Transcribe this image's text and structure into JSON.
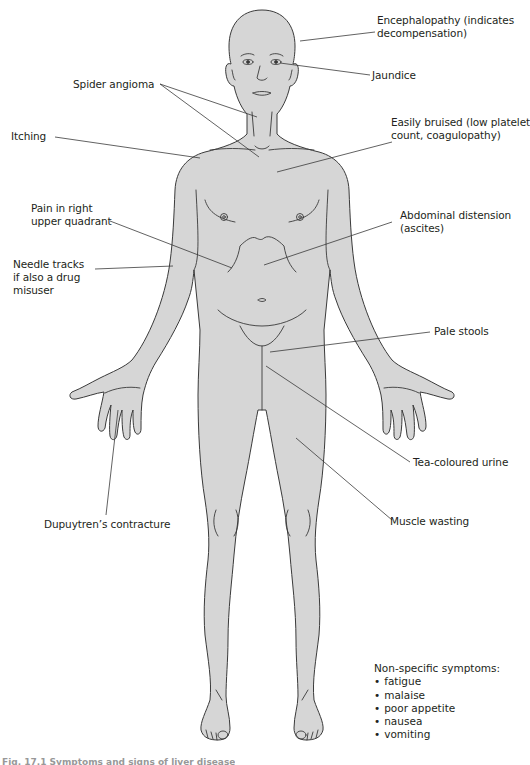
{
  "figure": {
    "type": "anatomical-diagram",
    "colors": {
      "skin_fill": "#d6d6d6",
      "outline": "#3a3a3a",
      "leader_line": "#3a3a3a",
      "text": "#231f20",
      "background": "#ffffff"
    }
  },
  "labels": {
    "encephalopathy": [
      "Encephalopathy (indicates",
      "decompensation)"
    ],
    "jaundice": [
      "Jaundice"
    ],
    "spider_angioma": [
      "Spider angioma"
    ],
    "itching": [
      "Itching"
    ],
    "easily_bruised": [
      "Easily bruised (low platelet",
      "count, coagulopathy)"
    ],
    "pain_ruq": [
      "Pain in right",
      "upper quadrant"
    ],
    "abdominal_distension": [
      "Abdominal distension",
      "(ascites)"
    ],
    "needle_tracks": [
      "Needle tracks",
      "if also a drug",
      "misuser"
    ],
    "pale_stools": [
      "Pale stools"
    ],
    "tea_coloured_urine": [
      "Tea-coloured urine"
    ],
    "dupuytrens": [
      "Dupuytren’s contracture"
    ],
    "muscle_wasting": [
      "Muscle wasting"
    ]
  },
  "non_specific": {
    "title": "Non-specific symptoms:",
    "items": [
      "fatigue",
      "malaise",
      "poor appetite",
      "nausea",
      "vomiting"
    ]
  },
  "caption": {
    "text": "Fig. 17.1 Symptoms and signs of liver disease"
  }
}
